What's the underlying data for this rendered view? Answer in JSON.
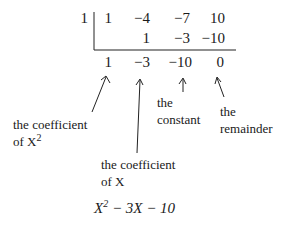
{
  "synthetic_division": {
    "divisor": "1",
    "row1": [
      "1",
      "−4",
      "−7",
      "10"
    ],
    "row2": [
      "",
      "1",
      "−3",
      "−10"
    ],
    "result": [
      "1",
      "−3",
      "−10",
      "0"
    ]
  },
  "annotations": {
    "coef_x2": {
      "line1": "the coefficient",
      "line2": "of X",
      "sup": "2"
    },
    "coef_x": {
      "line1": "the coefficient",
      "line2": "of X"
    },
    "constant": {
      "line1": "the",
      "line2": "constant"
    },
    "remainder": {
      "line1": "the",
      "line2": "remainder"
    }
  },
  "quotient": {
    "base1": "X",
    "exp": "2",
    "rest": " − 3X − 10"
  }
}
